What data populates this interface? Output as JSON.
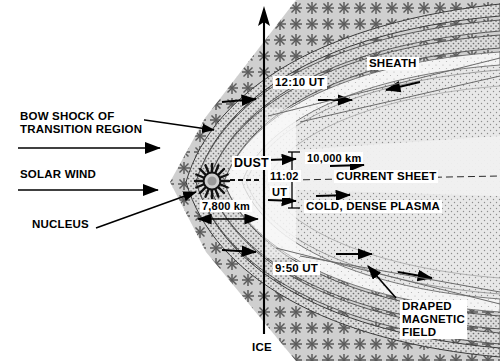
{
  "figure": {
    "background_color": "#ffffff",
    "ink_color": "#000000",
    "width": 500,
    "height": 361
  },
  "labels": {
    "bow_shock": "BOW SHOCK OF\nTRANSITION REGION",
    "solar_wind": "SOLAR WIND",
    "nucleus": "NUCLEUS",
    "dust": "DUST",
    "sheath": "SHEATH",
    "current_sheet": "CURRENT SHEET",
    "cold_dense_plasma": "COLD, DENSE PLASMA",
    "draped_magnetic_field": "DRAPED\nMAGNETIC\nFIELD",
    "spacecraft": "ICE"
  },
  "times": {
    "top": "12:10 UT",
    "middle_line1": "11:02",
    "middle_line2": "UT",
    "bottom": "9:50 UT"
  },
  "scales": {
    "dust_width": "7,800 km",
    "current_sheet_thickness": "10,000 km"
  },
  "regions": {
    "sheath_fill": "#c9c9c9",
    "transition_fill": "#d0d0d0",
    "inner_fill": "#f2f2f2",
    "plasma_fill": "#e4e4e4",
    "current_sheet_fill": "#efefef"
  }
}
